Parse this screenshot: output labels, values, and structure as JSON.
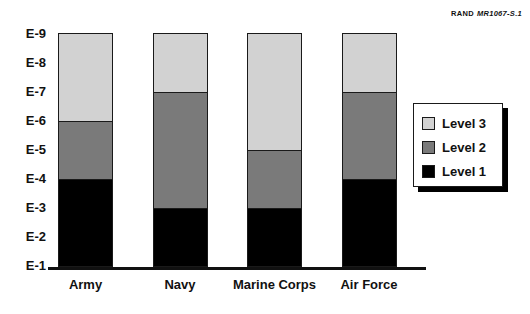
{
  "credit": {
    "org": "RAND",
    "code": "MR1067-S.1"
  },
  "chart_data": {
    "type": "bar",
    "subtype": "stacked",
    "title": "",
    "xlabel": "",
    "ylabel": "",
    "categories": [
      "Army",
      "Navy",
      "Marine Corps",
      "Air Force"
    ],
    "ytick_labels": [
      "E-1",
      "E-2",
      "E-3",
      "E-4",
      "E-5",
      "E-6",
      "E-7",
      "E-8",
      "E-9"
    ],
    "ylim": [
      "E-1",
      "E-9"
    ],
    "grid": false,
    "legend_position": "right",
    "series": [
      {
        "name": "Level 1",
        "color": "#000000",
        "top_grade": [
          "E-4",
          "E-3",
          "E-3",
          "E-4"
        ],
        "values": [
          4,
          3,
          3,
          4
        ]
      },
      {
        "name": "Level 2",
        "color": "#7a7a7a",
        "top_grade": [
          "E-6",
          "E-7",
          "E-5",
          "E-7"
        ],
        "values": [
          2,
          4,
          2,
          3
        ]
      },
      {
        "name": "Level 3",
        "color": "#d2d2d2",
        "top_grade": [
          "E-9",
          "E-9",
          "E-9",
          "E-9"
        ],
        "values": [
          3,
          2,
          4,
          2
        ]
      }
    ]
  }
}
